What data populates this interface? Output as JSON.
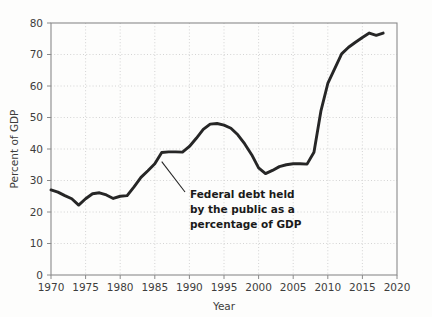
{
  "chart_data": {
    "type": "line",
    "title": "",
    "xlabel": "Year",
    "ylabel": "Percent of GDP",
    "xlim": [
      1970,
      2020
    ],
    "ylim": [
      0,
      80
    ],
    "grid": true,
    "legend": "none",
    "xticks": [
      1970,
      1975,
      1980,
      1985,
      1990,
      1995,
      2000,
      2005,
      2010,
      2015,
      2020
    ],
    "yticks": [
      0,
      10,
      20,
      30,
      40,
      50,
      60,
      70,
      80
    ],
    "annotations": [
      {
        "name": "series-callout",
        "lines": [
          "Federal debt held",
          "by the public as a",
          "percentage of GDP"
        ],
        "text": "Federal debt held by the public as a percentage of GDP",
        "points_to_year": 1986,
        "points_to_value": 36
      }
    ],
    "series": [
      {
        "name": "Federal debt held by the public as a percentage of GDP",
        "color": "#262626",
        "x": [
          1970,
          1971,
          1972,
          1973,
          1974,
          1975,
          1976,
          1977,
          1978,
          1979,
          1980,
          1981,
          1982,
          1983,
          1984,
          1985,
          1986,
          1987,
          1988,
          1989,
          1990,
          1991,
          1992,
          1993,
          1994,
          1995,
          1996,
          1997,
          1998,
          1999,
          2000,
          2001,
          2002,
          2003,
          2004,
          2005,
          2006,
          2007,
          2008,
          2009,
          2010,
          2011,
          2012,
          2013,
          2014,
          2015,
          2016,
          2017,
          2018
        ],
        "values": [
          27.0,
          26.3,
          25.2,
          24.2,
          22.2,
          24.2,
          25.8,
          26.1,
          25.4,
          24.3,
          25.0,
          25.2,
          28.0,
          31.0,
          33.1,
          35.3,
          38.9,
          39.1,
          39.1,
          39.0,
          40.8,
          43.4,
          46.2,
          47.9,
          48.1,
          47.6,
          46.6,
          44.5,
          41.6,
          38.2,
          34.0,
          32.2,
          33.2,
          34.4,
          35.0,
          35.3,
          35.3,
          35.2,
          39.0,
          52.0,
          60.8,
          65.5,
          70.2,
          72.3,
          73.9,
          75.4,
          76.8,
          76.1,
          76.8
        ]
      }
    ]
  }
}
